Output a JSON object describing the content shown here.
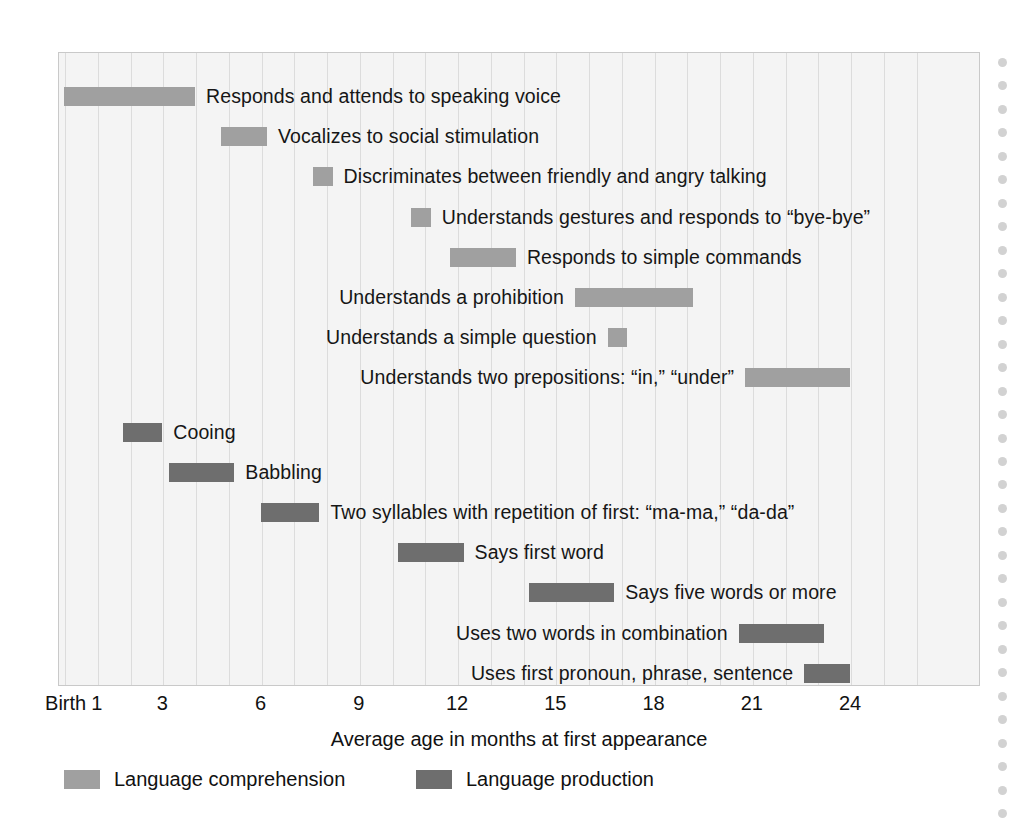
{
  "chart_data": {
    "type": "bar",
    "subtype": "range-bar-timeline",
    "title": "",
    "xlabel": "Average age in months at first appearance",
    "ylabel": "",
    "xlim": [
      0,
      26
    ],
    "x_tick_labels": [
      "Birth",
      "1",
      "3",
      "6",
      "9",
      "12",
      "15",
      "18",
      "21",
      "24"
    ],
    "x_tick_values": [
      0,
      1,
      3,
      6,
      9,
      12,
      15,
      18,
      21,
      24
    ],
    "grid": true,
    "grid_axis": "x",
    "grid_interval_months": 1,
    "legend_position": "bottom-left",
    "legend": [
      {
        "name": "Language comprehension",
        "color": "#a0a0a0"
      },
      {
        "name": "Language production",
        "color": "#6e6e6e"
      }
    ],
    "categories": [
      "Responds and attends to speaking voice",
      "Vocalizes to social stimulation",
      "Discriminates between friendly and angry talking",
      "Understands gestures and responds to “bye-bye”",
      "Responds to simple commands",
      "Understands a prohibition",
      "Understands a simple question",
      "Understands two prepositions: “in,” “under”",
      "Cooing",
      "Babbling",
      "Two syllables with repetition of first: “ma-ma,” “da-da”",
      "Says first word",
      "Says five words or more",
      "Uses two words in combination",
      "Uses first pronoun, phrase, sentence"
    ],
    "bars": [
      {
        "label": "Responds and attends to speaking voice",
        "series": "Language comprehension",
        "start_month": 0,
        "end_month": 4,
        "label_side": "right"
      },
      {
        "label": "Vocalizes to social stimulation",
        "series": "Language comprehension",
        "start_month": 4.8,
        "end_month": 6.2,
        "label_side": "right"
      },
      {
        "label": "Discriminates between friendly and angry talking",
        "series": "Language comprehension",
        "start_month": 7.6,
        "end_month": 8.2,
        "label_side": "right"
      },
      {
        "label": "Understands gestures and responds to “bye-bye”",
        "series": "Language comprehension",
        "start_month": 10.6,
        "end_month": 11.2,
        "label_side": "right"
      },
      {
        "label": "Responds to simple commands",
        "series": "Language comprehension",
        "start_month": 11.8,
        "end_month": 13.8,
        "label_side": "right"
      },
      {
        "label": "Understands a prohibition",
        "series": "Language comprehension",
        "start_month": 15.6,
        "end_month": 19.2,
        "label_side": "left"
      },
      {
        "label": "Understands a simple question",
        "series": "Language comprehension",
        "start_month": 16.6,
        "end_month": 17.2,
        "label_side": "left"
      },
      {
        "label": "Understands two prepositions: “in,” “under”",
        "series": "Language comprehension",
        "start_month": 20.8,
        "end_month": 24.0,
        "label_side": "left"
      },
      {
        "label": "Cooing",
        "series": "Language production",
        "start_month": 1.8,
        "end_month": 3.0,
        "label_side": "right"
      },
      {
        "label": "Babbling",
        "series": "Language production",
        "start_month": 3.2,
        "end_month": 5.2,
        "label_side": "right"
      },
      {
        "label": "Two syllables with repetition of first: “ma-ma,” “da-da”",
        "series": "Language production",
        "start_month": 6.0,
        "end_month": 7.8,
        "label_side": "right"
      },
      {
        "label": "Says first word",
        "series": "Language production",
        "start_month": 10.2,
        "end_month": 12.2,
        "label_side": "right"
      },
      {
        "label": "Says five words or more",
        "series": "Language production",
        "start_month": 14.2,
        "end_month": 16.8,
        "label_side": "right"
      },
      {
        "label": "Uses two words in combination",
        "series": "Language production",
        "start_month": 20.6,
        "end_month": 23.2,
        "label_side": "left"
      },
      {
        "label": "Uses first pronoun, phrase, sentence",
        "series": "Language production",
        "start_month": 22.6,
        "end_month": 24.0,
        "label_side": "left"
      }
    ]
  },
  "axis": {
    "title": "Average age in months at first appearance",
    "ticks": [
      "Birth",
      "1",
      "3",
      "6",
      "9",
      "12",
      "15",
      "18",
      "21",
      "24"
    ]
  },
  "legend": {
    "comprehension_label": "Language comprehension",
    "production_label": "Language production"
  },
  "colors": {
    "comprehension": "#a0a0a0",
    "production": "#6e6e6e",
    "plot_background": "#f4f4f4",
    "gridline": "#dcdcdc",
    "frame_border": "#c9c9c9",
    "text": "#161616"
  }
}
